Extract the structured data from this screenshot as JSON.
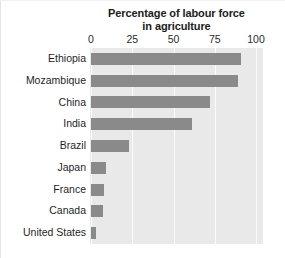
{
  "chart_data": {
    "type": "bar",
    "orientation": "horizontal",
    "title": "Percentage of labour force in agriculture",
    "title_lines": [
      "Percentage of labour force",
      "in agriculture"
    ],
    "xlabel": "",
    "ylabel": "",
    "xlim": [
      0,
      100
    ],
    "xticks": [
      0,
      25,
      50,
      75,
      100
    ],
    "xtick_labels": [
      "0",
      "25",
      "50",
      "75",
      "100"
    ],
    "grid": true,
    "grid_axis": "x",
    "legend": false,
    "categories": [
      "Ethiopia",
      "Mozambique",
      "China",
      "India",
      "Brazil",
      "Japan",
      "France",
      "Canada",
      "United States"
    ],
    "values": [
      91,
      89,
      72,
      61,
      23,
      9,
      8,
      7,
      3
    ],
    "colors": {
      "bar": "#8a8a8a",
      "plot_background": "#e9e9e9",
      "gridline": "#fbfbfb",
      "figure_background": "#ffffff",
      "text": "#1f1f1f"
    }
  }
}
